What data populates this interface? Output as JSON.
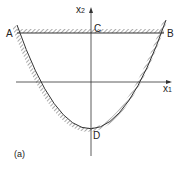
{
  "figure": {
    "panel_label": "(a)",
    "axes": {
      "x_label": "x",
      "x_sub": "1",
      "y_label": "x",
      "y_sub": "2"
    },
    "points": {
      "A": "A",
      "B": "B",
      "C": "C",
      "D": "D"
    }
  }
}
